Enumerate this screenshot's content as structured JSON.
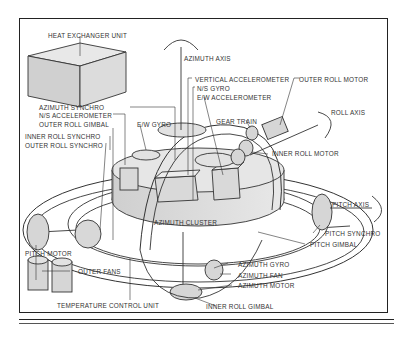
{
  "diagram": {
    "labels": {
      "heat_exchanger_unit": "HEAT EXCHANGER UNIT",
      "azimuth_axis": "AZIMUTH AXIS",
      "vertical_accelerometer": "VERTICAL ACCELEROMETER",
      "ns_gyro": "N/S GYRO",
      "ew_accelerometer": "E/W ACCELEROMETER",
      "outer_roll_motor": "OUTER ROLL MOTOR",
      "roll_axis": "ROLL AXIS",
      "azimuth_synchro": "AZIMUTH SYNCHRO",
      "ns_accelerometer": "N/S ACCELEROMETER",
      "outer_roll_gimbal": "OUTER ROLL GIMBAL",
      "ew_gyro": "E/W GYRO",
      "gear_train": "GEAR TRAIN",
      "inner_roll_synchro": "INNER ROLL SYNCHRO",
      "outer_roll_synchro": "OUTER ROLL SYNCHRO",
      "inner_roll_motor": "INNER ROLL MOTOR",
      "azimuth_cluster": "AZIMUTH CLUSTER",
      "pitch_axis": "PITCH AXIS",
      "pitch_synchro": "PITCH SYNCHRO",
      "pitch_gimbal": "PITCH GIMBAL",
      "pitch_motor": "PITCH MOTOR",
      "outer_fans": "OUTER FANS",
      "azimuth_gyro": "AZIMUTH GYRO",
      "azimuth_fan": "AZIMUTH FAN",
      "azimuth_motor": "AZIMUTH MOTOR",
      "temperature_control_unit": "TEMPERATURE CONTROL UNIT",
      "inner_roll_gimbal": "INNER ROLL GIMBAL"
    }
  }
}
